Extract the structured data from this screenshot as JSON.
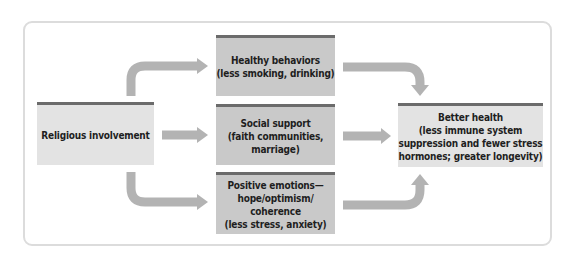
{
  "diagram": {
    "source": {
      "label": "Religious involvement"
    },
    "mediators": [
      {
        "label": "Healthy behaviors\n(less smoking, drinking)"
      },
      {
        "label": "Social support\n(faith communities,\nmarriage)"
      },
      {
        "label": "Positive emotions—\nhope/optimism/\ncoherence\n(less stress, anxiety)"
      }
    ],
    "outcome": {
      "label": "Better health\n(less immune system\nsuppression and fewer stress\nhormones; greater longevity)"
    },
    "edges": [
      {
        "from": "Religious involvement",
        "to": "Healthy behaviors"
      },
      {
        "from": "Religious involvement",
        "to": "Social support"
      },
      {
        "from": "Religious involvement",
        "to": "Positive emotions"
      },
      {
        "from": "Healthy behaviors",
        "to": "Better health"
      },
      {
        "from": "Social support",
        "to": "Better health"
      },
      {
        "from": "Positive emotions",
        "to": "Better health"
      }
    ],
    "colors": {
      "arrow": "#b3b3b3",
      "box_light": "#e3e3e3",
      "box_mid": "#c9c9c9",
      "box_border": "#6b6b6b",
      "frame": "#dcdcdc"
    }
  }
}
